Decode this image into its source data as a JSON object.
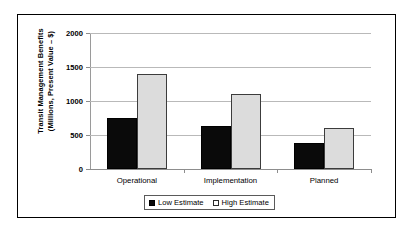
{
  "chart_data": {
    "type": "bar",
    "title": "",
    "xlabel": "",
    "ylabel": "Transit Management Benefits (Millions, Present Value – $)",
    "ylabel_line1": "Transit Management Benefits",
    "ylabel_line2": "(Millions, Present Value – $)",
    "categories": [
      "Operational",
      "Implementation",
      "Planned"
    ],
    "series": [
      {
        "name": "Low Estimate",
        "values": [
          750,
          630,
          380
        ],
        "color": "#0a0a0a"
      },
      {
        "name": "High Estimate",
        "values": [
          1400,
          1110,
          610
        ],
        "color": "#dcdcdc"
      }
    ],
    "ylim": [
      0,
      2000
    ],
    "ytick_labels": [
      "2000",
      "1500",
      "1000",
      "500",
      "0"
    ],
    "ytick_values": [
      2000,
      1500,
      1000,
      500,
      0
    ],
    "grid": true,
    "legend_position": "bottom-center"
  },
  "legend": {
    "entries": [
      {
        "label": "Low Estimate",
        "swatch": "filled-square-icon"
      },
      {
        "label": "High Estimate",
        "swatch": "open-square-icon"
      }
    ]
  }
}
